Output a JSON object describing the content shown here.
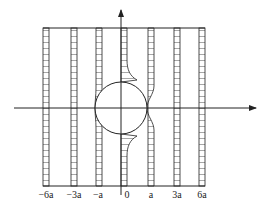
{
  "diagram": {
    "type": "velocity-profile strips around cylinder",
    "axis_labels": [
      "-6a",
      "-3a",
      "-a",
      "0",
      "a",
      "3a",
      "6a"
    ],
    "colors": {
      "line": "#222222",
      "background": "#ffffff"
    }
  },
  "labels": {
    "m6a": "−6a",
    "m3a": "−3a",
    "ma": "−a",
    "zero": "0",
    "a": "a",
    "p3a": "3a",
    "p6a": "6a"
  }
}
